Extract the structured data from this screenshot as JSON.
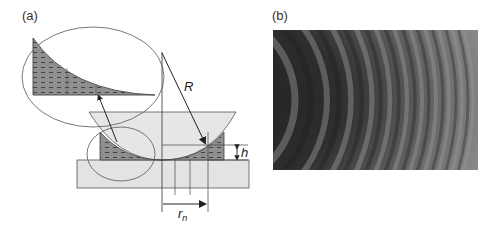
{
  "figure": {
    "panels": [
      {
        "label": "(a)",
        "description": "Newton's rings setup: plano-convex lens of radius R resting on a flat glass plate, air-gap wedge shaded, magnified inset of the gap",
        "annotations": {
          "radius": "R",
          "gap_height": "h",
          "ring_radius": "r",
          "ring_radius_subscript": "n"
        }
      },
      {
        "label": "(b)",
        "description": "Photograph of Newton's interference rings (partial view, concentric arcs)"
      }
    ]
  },
  "colors": {
    "lens_fill": "#e6e6e6",
    "plate_fill": "#e3e3e3",
    "gap_fill": "#8f8f8f",
    "line": "#333333",
    "fringe_dark": "#2a2a2a",
    "fringe_light": "#8a8a8a"
  }
}
